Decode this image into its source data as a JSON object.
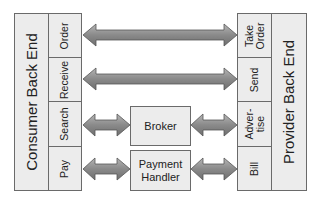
{
  "consumer": {
    "title": "Consumer Back End",
    "functions": [
      "Order",
      "Receive",
      "Search",
      "Pay"
    ]
  },
  "provider": {
    "title": "Provider Back End",
    "functions": [
      "Take\nOrder",
      "Send",
      "Adver-\ntise",
      "Bill"
    ]
  },
  "intermediaries": {
    "broker": "Broker",
    "payment_handler": "Payment\nHandler"
  },
  "colors": {
    "box_fill": "#ececec",
    "box_border": "#6a6a6a",
    "arrow_fill": "#8c8c8c",
    "arrow_border": "#555555"
  }
}
